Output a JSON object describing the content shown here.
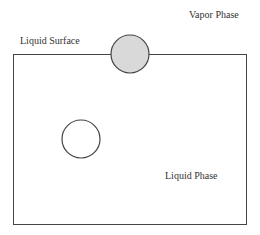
{
  "labels": {
    "vapor_phase": "Vapor Phase",
    "liquid_surface": "Liquid Surface",
    "liquid_phase": "Liquid Phase"
  },
  "colors": {
    "stroke": "#444444",
    "surface_particle_fill": "#d9d9d9",
    "bulk_particle_fill": "#ffffff",
    "background": "#ffffff"
  },
  "elements": {
    "container": {
      "x": 13,
      "y": 54,
      "width": 233,
      "height": 170
    },
    "surface_particle": {
      "cx": 130,
      "cy": 54,
      "r": 19
    },
    "bulk_particle": {
      "cx": 81,
      "cy": 139,
      "r": 19
    }
  }
}
